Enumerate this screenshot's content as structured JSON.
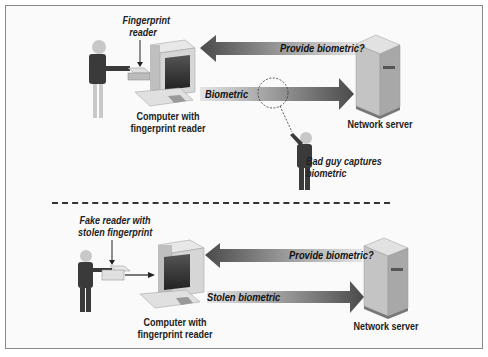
{
  "top_scenario": {
    "fingerprint_reader_label": [
      "Fingerprint",
      "reader"
    ],
    "computer_label": [
      "Computer with",
      "fingerprint reader"
    ],
    "request_arrow_label": "Provide biometric?",
    "response_arrow_label": "Biometric",
    "server_label": "Network server",
    "attacker_label": [
      "Bad guy captures",
      "biometric"
    ]
  },
  "bottom_scenario": {
    "fake_reader_label": [
      "Fake reader with",
      "stolen fingerprint"
    ],
    "computer_label": [
      "Computer with",
      "fingerprint reader"
    ],
    "request_arrow_label": "Provide biometric?",
    "response_arrow_label": "Stolen biometric",
    "server_label": "Network server"
  },
  "colors": {
    "arrow_dark": "#555555",
    "arrow_light": "#e0e0e0",
    "figure_dark": "#3a3a3a",
    "skin": "#c8c8c8",
    "server": "#bdbdbd",
    "computer": "#d6d6d6"
  }
}
